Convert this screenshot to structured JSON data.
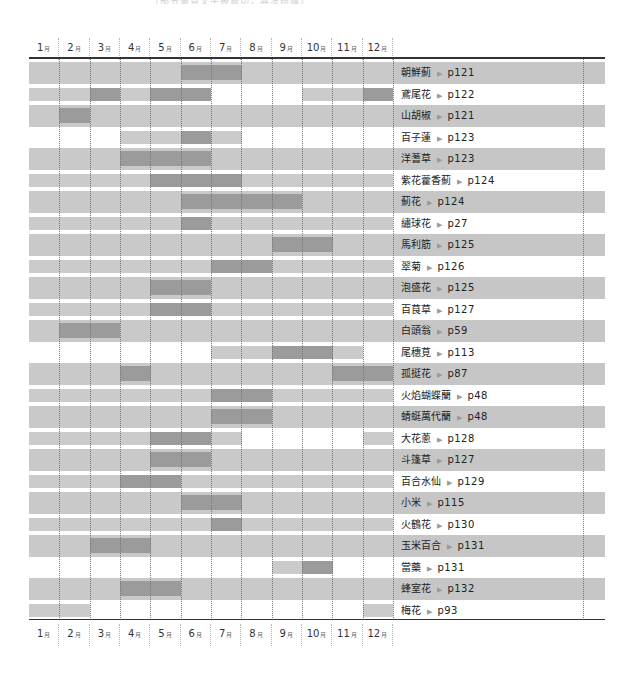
{
  "caption": "（部分書頁文字被裁切，無法辨識）",
  "months": [
    "1",
    "2",
    "3",
    "4",
    "5",
    "6",
    "7",
    "8",
    "9",
    "10",
    "11",
    "12"
  ],
  "month_unit": "月",
  "arrow_glyph": "▶",
  "colors": {
    "band_gray": "#c9c9c9",
    "light_bar": "#cbcbcb",
    "dark_bar": "#9b9b9b",
    "line": "#333333"
  },
  "chart_data": {
    "type": "table",
    "title": "",
    "xlabel": "月",
    "categories": [
      "1月",
      "2月",
      "3月",
      "4月",
      "5月",
      "6月",
      "7月",
      "8月",
      "9月",
      "10月",
      "11月",
      "12月"
    ],
    "legend": {
      "light": "一般期間",
      "dark": "盛期"
    },
    "rows": [
      {
        "name": "朝鮮薊",
        "page": "p121",
        "light": [
          1,
          2,
          3,
          4,
          5,
          8,
          9,
          10,
          11,
          12
        ],
        "dark": [
          6,
          7
        ]
      },
      {
        "name": "鳶尾花",
        "page": "p122",
        "light": [
          1,
          2,
          4,
          10,
          11
        ],
        "dark": [
          3,
          5,
          6,
          12
        ]
      },
      {
        "name": "山胡椒",
        "page": "p121",
        "light": [
          1,
          3,
          4,
          5,
          6,
          7,
          8,
          9,
          10,
          11,
          12
        ],
        "dark": [
          2
        ]
      },
      {
        "name": "百子蓮",
        "page": "p123",
        "light": [
          4,
          5,
          7
        ],
        "dark": [
          6
        ]
      },
      {
        "name": "洋蓍草",
        "page": "p123",
        "light": [
          1,
          2,
          3,
          7,
          8,
          9,
          10,
          11,
          12
        ],
        "dark": [
          4,
          5,
          6
        ]
      },
      {
        "name": "紫花藿香薊",
        "page": "p124",
        "light": [
          1,
          2,
          3,
          4,
          8,
          9,
          10,
          11,
          12
        ],
        "dark": [
          5,
          6,
          7
        ]
      },
      {
        "name": "薊花",
        "page": "p124",
        "light": [
          1,
          2,
          3,
          4,
          5,
          10,
          11,
          12
        ],
        "dark": [
          6,
          7,
          8,
          9
        ]
      },
      {
        "name": "繡球花",
        "page": "p27",
        "light": [
          1,
          2,
          3,
          4,
          5,
          7,
          8,
          9,
          10,
          11,
          12
        ],
        "dark": [
          6
        ]
      },
      {
        "name": "馬利筋",
        "page": "p125",
        "light": [
          1,
          2,
          3,
          4,
          5,
          6,
          7,
          8,
          11,
          12
        ],
        "dark": [
          9,
          10
        ]
      },
      {
        "name": "翠菊",
        "page": "p126",
        "light": [
          1,
          2,
          3,
          4,
          5,
          6,
          9,
          10,
          11,
          12
        ],
        "dark": [
          7,
          8
        ]
      },
      {
        "name": "泡盛花",
        "page": "p125",
        "light": [
          1,
          2,
          3,
          4,
          7,
          8,
          9,
          10,
          11,
          12
        ],
        "dark": [
          5,
          6
        ]
      },
      {
        "name": "百茛草",
        "page": "p127",
        "light": [
          1,
          2,
          3,
          4,
          7,
          8,
          9,
          10,
          11,
          12
        ],
        "dark": [
          5,
          6
        ]
      },
      {
        "name": "白頭翁",
        "page": "p59",
        "light": [
          1,
          4,
          5,
          6,
          7,
          8,
          9,
          10,
          11,
          12
        ],
        "dark": [
          2,
          3
        ]
      },
      {
        "name": "尾穗莧",
        "page": "p113",
        "light": [
          7,
          8,
          11
        ],
        "dark": [
          9,
          10
        ]
      },
      {
        "name": "孤挺花",
        "page": "p87",
        "light": [
          1,
          2,
          3,
          5,
          6,
          7,
          8,
          9,
          10
        ],
        "dark": [
          4,
          11,
          12
        ]
      },
      {
        "name": "火焰蝴蝶蘭",
        "page": "p48",
        "light": [
          1,
          2,
          3,
          4,
          5,
          6,
          9,
          10,
          11,
          12
        ],
        "dark": [
          7,
          8
        ]
      },
      {
        "name": "蜻蜓萬代蘭",
        "page": "p48",
        "light": [
          1,
          2,
          3,
          4,
          5,
          6,
          9,
          10,
          11,
          12
        ],
        "dark": [
          7,
          8
        ]
      },
      {
        "name": "大花蔥",
        "page": "p128",
        "light": [
          1,
          2,
          3,
          4,
          7,
          12
        ],
        "dark": [
          5,
          6
        ]
      },
      {
        "name": "斗篷草",
        "page": "p127",
        "light": [
          1,
          2,
          3,
          4,
          7,
          8,
          9,
          10,
          11,
          12
        ],
        "dark": [
          5,
          6
        ]
      },
      {
        "name": "百合水仙",
        "page": "p129",
        "light": [
          1,
          2,
          3,
          6,
          7,
          8,
          9,
          10,
          11,
          12
        ],
        "dark": [
          4,
          5
        ]
      },
      {
        "name": "小米",
        "page": "p115",
        "light": [
          1,
          2,
          3,
          4,
          5,
          8,
          9,
          10,
          11,
          12
        ],
        "dark": [
          6,
          7
        ]
      },
      {
        "name": "火鶴花",
        "page": "p130",
        "light": [
          1,
          2,
          3,
          4,
          5,
          6,
          8,
          9,
          10,
          11,
          12
        ],
        "dark": [
          7
        ]
      },
      {
        "name": "玉米百合",
        "page": "p131",
        "light": [
          1,
          2,
          5,
          6,
          7,
          8,
          9,
          10,
          11,
          12
        ],
        "dark": [
          3,
          4
        ]
      },
      {
        "name": "當藥",
        "page": "p131",
        "light": [
          9
        ],
        "dark": [
          10
        ]
      },
      {
        "name": "蜂室花",
        "page": "p132",
        "light": [
          1,
          2,
          3,
          6,
          7,
          8,
          9,
          10,
          11,
          12
        ],
        "dark": [
          4,
          5
        ]
      },
      {
        "name": "梅花",
        "page": "p93",
        "light": [
          1,
          2,
          12
        ],
        "dark": []
      }
    ]
  }
}
